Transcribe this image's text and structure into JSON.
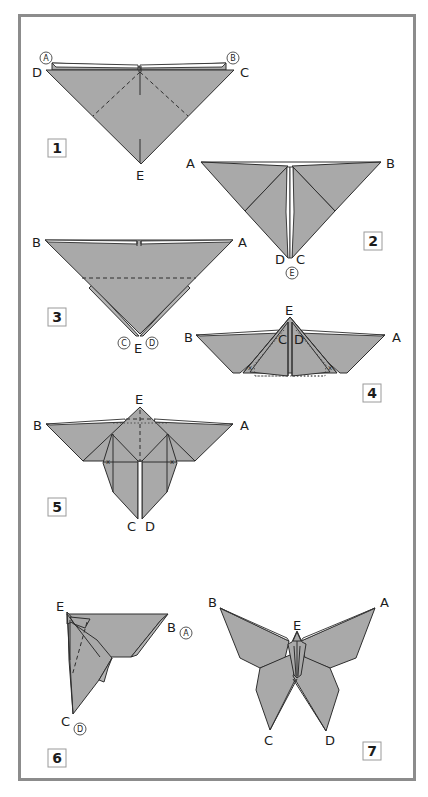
{
  "diagram": {
    "colors": {
      "paper": "#a9a9a9",
      "outline": "#2e2e2e",
      "frame": "#8c8c8c",
      "background": "#ffffff"
    },
    "steps": [
      {
        "number": "1",
        "labels": {
          "A": "A",
          "B": "B",
          "C": "C",
          "D": "D",
          "E": "E"
        },
        "circled": [
          "A",
          "B"
        ]
      },
      {
        "number": "2",
        "labels": {
          "A": "A",
          "B": "B",
          "C": "C",
          "D": "D",
          "E": "E"
        },
        "circled": [
          "E"
        ]
      },
      {
        "number": "3",
        "labels": {
          "A": "A",
          "B": "B",
          "C": "C",
          "D": "D",
          "E": "E"
        },
        "circled": [
          "C",
          "D"
        ]
      },
      {
        "number": "4",
        "labels": {
          "A": "A",
          "B": "B",
          "C": "C",
          "D": "D",
          "E": "E"
        },
        "marks": [
          "x",
          "x"
        ]
      },
      {
        "number": "5",
        "labels": {
          "A": "A",
          "B": "B",
          "C": "C",
          "D": "D",
          "E": "E"
        },
        "marks": [
          "x",
          "x"
        ]
      },
      {
        "number": "6",
        "labels": {
          "A": "A",
          "B": "B",
          "C": "C",
          "D": "D",
          "E": "E"
        },
        "circled": [
          "A",
          "D"
        ]
      },
      {
        "number": "7",
        "labels": {
          "A": "A",
          "B": "B",
          "C": "C",
          "D": "D",
          "E": "E"
        }
      }
    ]
  }
}
